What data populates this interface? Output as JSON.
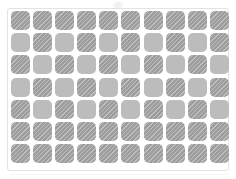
{
  "panel": {
    "title": "Grid Swatch Panel",
    "rows": 7,
    "columns": 10,
    "cell_count": 70,
    "frame_color": "#e3e3e3",
    "background_color": "#ffffff",
    "light_swatch_color": "#bcbcbc",
    "dark_swatch_color": "#9d9d9d",
    "hatch_color": "#ffffff",
    "hatch_angle": "135deg",
    "cell_shape": "rounded-square",
    "cell_size_px": 19,
    "cell_gap_px": 3
  },
  "legend": {
    "dark_label": "hatched",
    "light_label": "plain"
  },
  "artifacts": {
    "top_mark": "",
    "baseline_shadow": ""
  },
  "grid": {
    "rows": [
      {
        "index": 1,
        "pattern": "all-dark",
        "cells": [
          "dark",
          "dark",
          "dark",
          "dark",
          "dark",
          "dark",
          "dark",
          "dark",
          "dark",
          "dark"
        ]
      },
      {
        "index": 2,
        "pattern": "alternating-light-first",
        "cells": [
          "light",
          "dark",
          "light",
          "dark",
          "light",
          "dark",
          "light",
          "dark",
          "light",
          "dark"
        ]
      },
      {
        "index": 3,
        "pattern": "alternating-dark-first",
        "cells": [
          "dark",
          "light",
          "dark",
          "light",
          "dark",
          "light",
          "dark",
          "light",
          "dark",
          "light"
        ]
      },
      {
        "index": 4,
        "pattern": "alternating-light-first",
        "cells": [
          "light",
          "dark",
          "light",
          "dark",
          "light",
          "dark",
          "light",
          "dark",
          "light",
          "dark"
        ]
      },
      {
        "index": 5,
        "pattern": "alternating-dark-first",
        "cells": [
          "dark",
          "light",
          "dark",
          "light",
          "dark",
          "light",
          "dark",
          "light",
          "dark",
          "light"
        ]
      },
      {
        "index": 6,
        "pattern": "all-dark",
        "cells": [
          "dark",
          "dark",
          "dark",
          "dark",
          "dark",
          "dark",
          "dark",
          "dark",
          "dark",
          "dark"
        ]
      },
      {
        "index": 7,
        "pattern": "all-dark",
        "cells": [
          "dark",
          "dark",
          "dark",
          "dark",
          "dark",
          "dark",
          "dark",
          "dark",
          "dark",
          "dark"
        ]
      }
    ]
  }
}
